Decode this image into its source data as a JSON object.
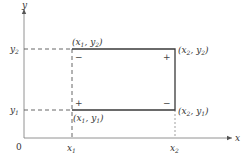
{
  "axes": {
    "x_label": "x",
    "y_label": "y",
    "origin_label": "0",
    "x_ticks": [
      {
        "base": "x",
        "sub": "1"
      },
      {
        "base": "x",
        "sub": "2"
      }
    ],
    "y_ticks": [
      {
        "base": "y",
        "sub": "2"
      },
      {
        "base": "y",
        "sub": "1"
      }
    ]
  },
  "rectangle": {
    "corners": {
      "top_left": {
        "x": "x",
        "xs": "1",
        "y": "y",
        "ys": "2",
        "sign": "−"
      },
      "top_right": {
        "x": "x",
        "xs": "2",
        "y": "y",
        "ys": "2",
        "sign": "+"
      },
      "bottom_left": {
        "x": "x",
        "xs": "1",
        "y": "y",
        "ys": "1",
        "sign": "+"
      },
      "bottom_right": {
        "x": "x",
        "xs": "2",
        "y": "y",
        "ys": "1",
        "sign": "−"
      }
    }
  },
  "colors": {
    "line": "#555555",
    "rect": "#3a3a3a",
    "text": "#333333"
  }
}
